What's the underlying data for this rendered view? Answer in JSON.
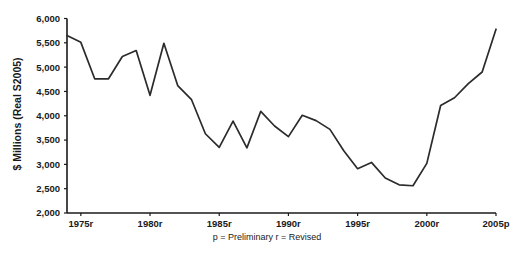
{
  "chart_data": {
    "type": "line",
    "title": "",
    "xlabel": "",
    "ylabel": "$ Millions (Real S2005)",
    "xlim": [
      1974,
      2005
    ],
    "ylim": [
      2000,
      6000
    ],
    "grid": false,
    "legend": false,
    "footnote": "p = Preliminary  r = Revised",
    "y_ticks": [
      2000,
      2500,
      3000,
      3500,
      4000,
      4500,
      5000,
      5500,
      6000
    ],
    "y_tick_labels": [
      "2,000",
      "2,500",
      "3,000",
      "3,500",
      "4,000",
      "4,500",
      "5,000",
      "5,500",
      "6,000"
    ],
    "x_ticks": [
      1975,
      1980,
      1985,
      1990,
      1995,
      2000,
      2005
    ],
    "x_tick_labels": [
      "1975r",
      "1980r",
      "1985r",
      "1990r",
      "1995r",
      "2000r",
      "2005p"
    ],
    "x": [
      1974,
      1975,
      1976,
      1977,
      1978,
      1979,
      1980,
      1981,
      1982,
      1983,
      1984,
      1985,
      1986,
      1987,
      1988,
      1989,
      1990,
      1991,
      1992,
      1993,
      1994,
      1995,
      1996,
      1997,
      1998,
      1999,
      2000,
      2001,
      2002,
      2003,
      2004,
      2005
    ],
    "values": [
      5650,
      5510,
      4760,
      4760,
      5220,
      5340,
      4420,
      5490,
      4620,
      4330,
      3630,
      3350,
      3890,
      3340,
      4090,
      3790,
      3570,
      4010,
      3900,
      3720,
      3280,
      2910,
      3040,
      2720,
      2580,
      2560,
      3020,
      4210,
      4370,
      4660,
      4900,
      5780
    ],
    "series": [
      {
        "name": "value",
        "color": "#2b2b2b",
        "values": [
          5650,
          5510,
          4760,
          4760,
          5220,
          5340,
          4420,
          5490,
          4620,
          4330,
          3630,
          3350,
          3890,
          3340,
          4090,
          3790,
          3570,
          4010,
          3900,
          3720,
          3280,
          2910,
          3040,
          2720,
          2580,
          2560,
          3020,
          4210,
          4370,
          4660,
          4900,
          5780
        ]
      }
    ]
  }
}
